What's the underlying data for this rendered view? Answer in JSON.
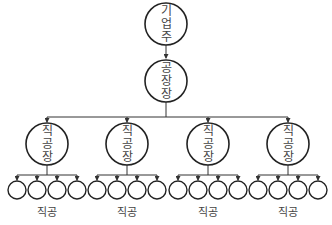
{
  "diagram": {
    "type": "org-chart",
    "root": {
      "label_chars": [
        "기",
        "업",
        "주"
      ],
      "label": "기업주"
    },
    "manager": {
      "label_chars": [
        "공",
        "장",
        "장"
      ],
      "label": "공장장"
    },
    "foremen": [
      {
        "label_chars": [
          "직",
          "공",
          "장"
        ],
        "label": "직공장",
        "workers": 4,
        "group_label": "직공"
      },
      {
        "label_chars": [
          "직",
          "공",
          "장"
        ],
        "label": "직공장",
        "workers": 4,
        "group_label": "직공"
      },
      {
        "label_chars": [
          "직",
          "공",
          "장"
        ],
        "label": "직공장",
        "workers": 4,
        "group_label": "직공"
      },
      {
        "label_chars": [
          "직",
          "공",
          "장"
        ],
        "label": "직공장",
        "workers": 4,
        "group_label": "직공"
      }
    ],
    "colors": {
      "stroke": "#222222",
      "text": "#444444",
      "background": "#ffffff"
    }
  }
}
